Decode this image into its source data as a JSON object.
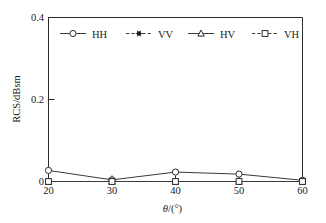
{
  "chart_data": {
    "type": "line",
    "title": "",
    "xlabel": "θ/(°)",
    "ylabel": "RCS/dBsm",
    "x": [
      20,
      30,
      40,
      50,
      60
    ],
    "xlim": [
      20,
      60
    ],
    "ylim": [
      0,
      0.4
    ],
    "xticks": [
      "20",
      "30",
      "40",
      "50",
      "60"
    ],
    "yticks": [
      "0",
      "0.2",
      "0.4"
    ],
    "ytick_values": [
      0,
      0.2,
      0.4
    ],
    "grid": false,
    "legend_position": "top-inside",
    "series": [
      {
        "name": "HH",
        "values": [
          0.027,
          0.004,
          0.023,
          0.018,
          0.003
        ],
        "line_style": "solid",
        "marker": "circle-open",
        "color": "#3a3a3a"
      },
      {
        "name": "VV",
        "values": [
          0.0,
          0.0,
          0.0,
          0.0,
          0.0
        ],
        "line_style": "dashed",
        "marker": "star-filled",
        "color": "#3a3a3a"
      },
      {
        "name": "HV",
        "values": [
          0.0,
          0.0,
          0.0,
          0.0,
          0.0
        ],
        "line_style": "solid",
        "marker": "triangle-open",
        "color": "#3a3a3a"
      },
      {
        "name": "VH",
        "values": [
          0.0,
          0.0,
          0.0,
          0.0,
          0.0
        ],
        "line_style": "dashed",
        "marker": "square-open",
        "color": "#3a3a3a"
      }
    ]
  },
  "axes": {
    "y_top_label": "0.4",
    "y_mid_label": "0.2",
    "y_zero_label": "0",
    "y_axis_title": "RCS/dBsm",
    "x_axis_title_theta": "θ",
    "x_axis_title_unit": "/(°)",
    "x_labels": [
      "20",
      "30",
      "40",
      "50",
      "60"
    ]
  },
  "legend": {
    "entries": [
      {
        "label": "HH",
        "marker_name": "circle-open-marker",
        "style": "solid"
      },
      {
        "label": "VV",
        "marker_name": "star-marker",
        "style": "dashed"
      },
      {
        "label": "HV",
        "marker_name": "triangle-open-marker",
        "style": "solid"
      },
      {
        "label": "VH",
        "marker_name": "square-open-marker",
        "style": "dashed"
      }
    ]
  },
  "colors": {
    "axis": "#2b2b2b",
    "line": "#3a3a3a",
    "marker_fill": "#ffffff",
    "background": "#ffffff"
  }
}
